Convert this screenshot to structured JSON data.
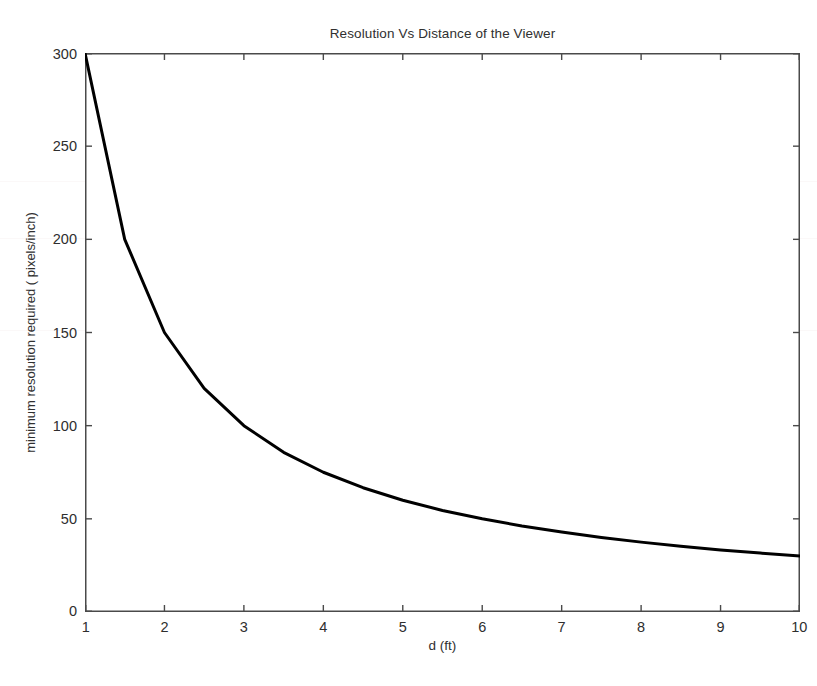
{
  "figure": {
    "width": 817,
    "height": 686,
    "background_color": "#ffffff"
  },
  "chart_data": {
    "type": "line",
    "title": "Resolution Vs Distance of the Viewer",
    "xlabel": "d (ft)",
    "ylabel": "minimum resolution required ( pixels/inch)",
    "xlim": [
      1,
      10
    ],
    "ylim": [
      0,
      300
    ],
    "xticks": [
      1,
      2,
      3,
      4,
      5,
      6,
      7,
      8,
      9,
      10
    ],
    "xticklabels": [
      "1",
      "2",
      "3",
      "4",
      "5",
      "6",
      "7",
      "8",
      "9",
      "10"
    ],
    "yticks": [
      0,
      50,
      100,
      150,
      200,
      250,
      300
    ],
    "yticklabels": [
      "0",
      "50",
      "100",
      "150",
      "200",
      "250",
      "300"
    ],
    "grid": false,
    "legend": null,
    "series": [
      {
        "name": "minimum resolution required",
        "color": "#000000",
        "line_width": 3,
        "relationship": "y = 300 / d",
        "x": [
          1,
          1.5,
          2,
          2.5,
          3,
          3.5,
          4,
          4.5,
          5,
          5.5,
          6,
          6.5,
          7,
          7.5,
          8,
          8.5,
          9,
          9.5,
          10
        ],
        "y": [
          300,
          200,
          150,
          120,
          100,
          85.7,
          75,
          66.7,
          60,
          54.5,
          50,
          46.2,
          42.9,
          40,
          37.5,
          35.3,
          33.3,
          31.6,
          30
        ]
      }
    ]
  },
  "axes": {
    "box_color": "#4a4a4a",
    "tick_color": "#4a4a4a",
    "tick_direction": "in",
    "box_on": true
  }
}
